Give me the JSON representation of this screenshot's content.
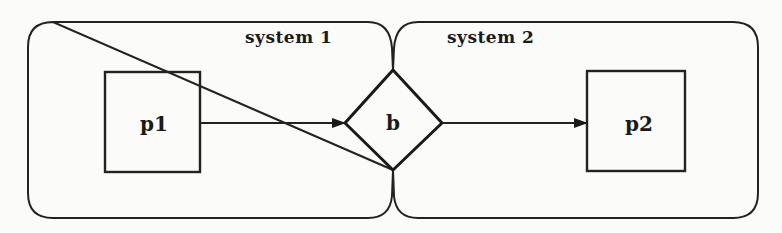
{
  "diagram": {
    "type": "system-composition",
    "systems": [
      {
        "id": "system1",
        "label": "system 1"
      },
      {
        "id": "system2",
        "label": "system 2"
      }
    ],
    "nodes": [
      {
        "id": "p1",
        "label": "p1",
        "shape": "rectangle",
        "system": "system 1"
      },
      {
        "id": "b",
        "label": "b",
        "shape": "diamond",
        "system": "shared (system 1 & system 2)"
      },
      {
        "id": "p2",
        "label": "p2",
        "shape": "rectangle",
        "system": "system 2"
      }
    ],
    "edges": [
      {
        "from": "p1",
        "to": "b",
        "style": "arrow"
      },
      {
        "from": "b",
        "to": "p2",
        "style": "arrow"
      }
    ],
    "colors": {
      "ink": "#222222",
      "background": "#fbfbf9"
    }
  }
}
